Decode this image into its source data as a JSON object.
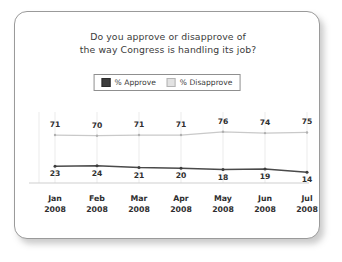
{
  "chart_data": {
    "type": "line",
    "title": "Do you approve or disapprove of the way Congress is handling its job?",
    "title_lines": [
      "Do you approve or disapprove of",
      "the way Congress is handling its job?"
    ],
    "categories": [
      "Jan 2008",
      "Feb 2008",
      "Mar 2008",
      "Apr 2008",
      "May 2008",
      "Jun 2008",
      "Jul 2008"
    ],
    "category_lines": [
      [
        "Jan",
        "2008"
      ],
      [
        "Feb",
        "2008"
      ],
      [
        "Mar",
        "2008"
      ],
      [
        "Apr",
        "2008"
      ],
      [
        "May",
        "2008"
      ],
      [
        "Jun",
        "2008"
      ],
      [
        "Jul",
        "2008"
      ]
    ],
    "series": [
      {
        "name": "% Disapprove",
        "values": [
          71,
          70,
          71,
          71,
          76,
          74,
          75
        ],
        "color": "#c9c9c9",
        "marker_color": "#b0b0b0"
      },
      {
        "name": "% Approve",
        "values": [
          23,
          24,
          21,
          20,
          18,
          19,
          14
        ],
        "color": "#4a4a4a",
        "marker_color": "#3d3d3d"
      }
    ],
    "legend": [
      {
        "label": "% Approve",
        "swatch": "approve",
        "color": "#3d3d3d"
      },
      {
        "label": "% Disapprove",
        "swatch": "disapprove",
        "color": "#e2e2e2"
      }
    ],
    "xlabel": "",
    "ylabel": "",
    "ylim": [
      0,
      100
    ],
    "grid": "vertical-only",
    "legend_position": "top-center",
    "axis_line_color": "#cfcfcf",
    "gridline_color": "#ebebeb",
    "card_border_color": "#9a9a9a",
    "text_color": "#2e2e2e"
  }
}
